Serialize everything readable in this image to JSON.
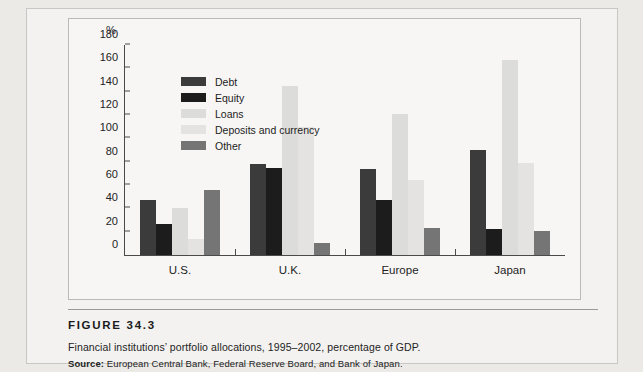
{
  "figure": {
    "number_label": "FIGURE  34.3",
    "description": "Financial institutions’ portfolio allocations, 1995–2002, percentage of GDP.",
    "source_prefix": "Source:",
    "source_text": " European Central Bank, Federal Reserve Board, and Bank of Japan."
  },
  "chart_data": {
    "type": "bar",
    "title": "",
    "xlabel": "",
    "ylabel": "%",
    "unit_label": "%",
    "ylim": [
      0,
      180
    ],
    "yticks": [
      0,
      20,
      40,
      60,
      80,
      100,
      120,
      140,
      160,
      180
    ],
    "grid": false,
    "legend_position": "inside-top-left",
    "categories": [
      "U.S.",
      "U.K.",
      "Europe",
      "Japan"
    ],
    "series": [
      {
        "name": "Debt",
        "color": "#3b3b3b",
        "values": [
          47,
          78,
          74,
          90
        ]
      },
      {
        "name": "Equity",
        "color": "#1c1c1c",
        "values": [
          27,
          75,
          47,
          22
        ]
      },
      {
        "name": "Loans",
        "color": "#dcdcda",
        "values": [
          40,
          145,
          121,
          167
        ]
      },
      {
        "name": "Deposits and currency",
        "color": "#e4e3e1",
        "values": [
          14,
          110,
          64,
          79
        ]
      },
      {
        "name": "Other",
        "color": "#757575",
        "values": [
          56,
          10,
          23,
          21
        ]
      }
    ]
  }
}
